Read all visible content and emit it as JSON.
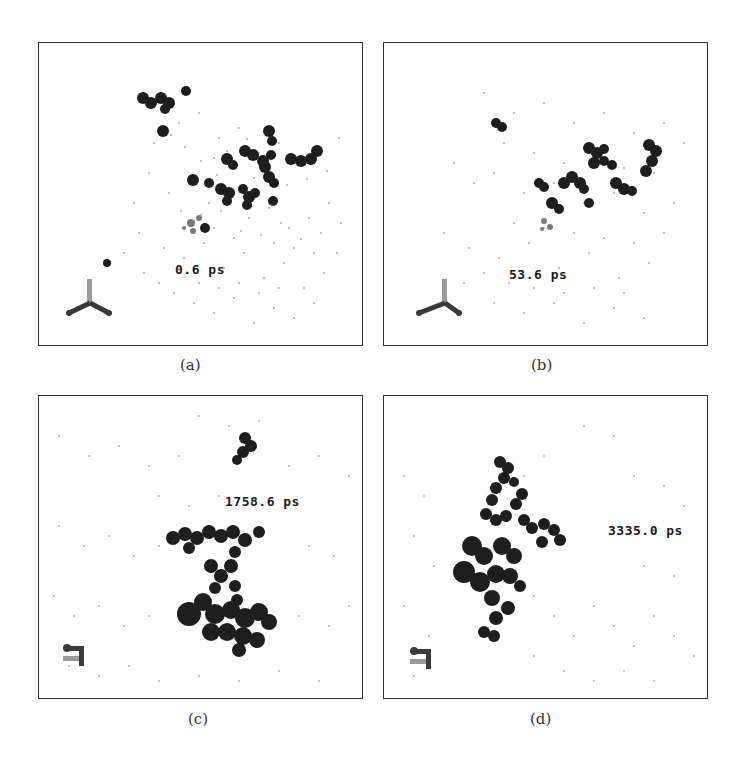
{
  "figure": {
    "panels": [
      {
        "id": "a",
        "caption": "(a)",
        "time_label": "0.6 ps"
      },
      {
        "id": "b",
        "caption": "(b)",
        "time_label": "53.6 ps"
      },
      {
        "id": "c",
        "caption": "(c)",
        "time_label": "1758.6 ps"
      },
      {
        "id": "d",
        "caption": "(d)",
        "time_label": "3335.0 ps"
      }
    ],
    "colors": {
      "molecule": "#1e1e1e",
      "solvent_dots": "#9a9a9a",
      "frame": "#333333",
      "axis_y": "#9a9a9a",
      "axis_xz": "#3a3a3a"
    }
  }
}
